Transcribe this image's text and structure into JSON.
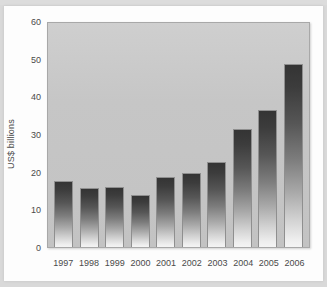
{
  "chart_data": {
    "type": "bar",
    "title": "",
    "subtitle": "",
    "xlabel": "",
    "ylabel": "US$ billions",
    "categories": [
      "1997",
      "1998",
      "1999",
      "2000",
      "2001",
      "2002",
      "2003",
      "2004",
      "2005",
      "2006"
    ],
    "values": [
      17.8,
      15.9,
      16.0,
      13.8,
      18.7,
      19.8,
      22.9,
      31.6,
      36.6,
      49.0
    ],
    "series": [
      {
        "name": "US$ billions",
        "values": [
          17.8,
          15.9,
          16.0,
          13.8,
          18.7,
          19.8,
          22.9,
          31.6,
          36.6,
          49.0
        ]
      }
    ],
    "ylim": [
      0,
      60
    ],
    "yticks": [
      0,
      10,
      20,
      30,
      40,
      50,
      60
    ],
    "ytick_labels": [
      "0",
      "10",
      "20",
      "30",
      "40",
      "50",
      "60"
    ],
    "grid": false,
    "legend": null,
    "annotations": [],
    "colors": {
      "bar_top": "#343434",
      "bar_bottom": "#f4f4f4",
      "plot_background": "#c6c6c6",
      "axis_text": "#4a4a4a",
      "card_background": "#fdfdfd",
      "page_background": "#d9d9d9"
    }
  }
}
